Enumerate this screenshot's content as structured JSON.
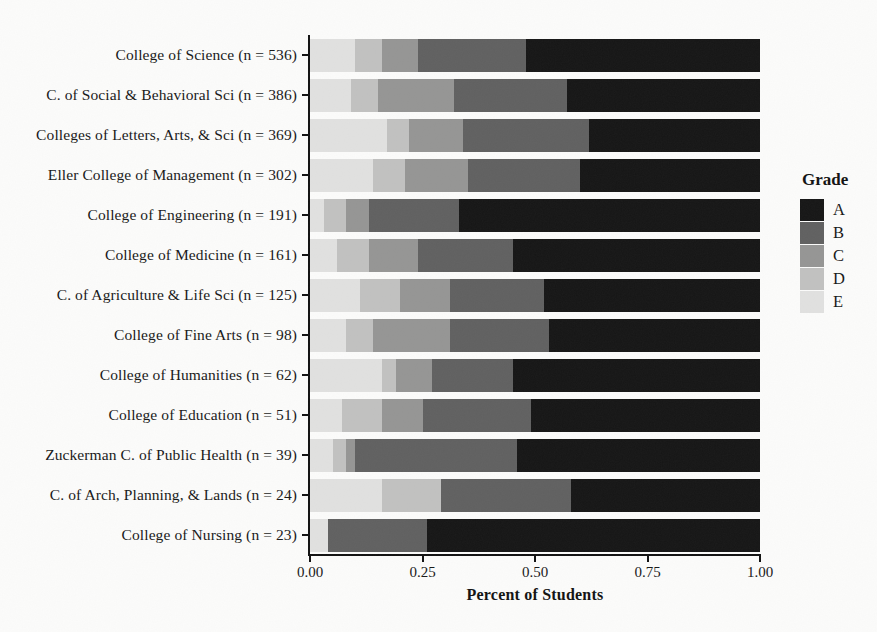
{
  "chart_data": {
    "type": "bar",
    "orientation": "horizontal",
    "stacked": true,
    "title": "",
    "xlabel": "Percent of Students",
    "ylabel": "",
    "xlim": [
      0,
      1
    ],
    "grid": false,
    "x_ticks": [
      {
        "value": 0.0,
        "label": "0.00"
      },
      {
        "value": 0.25,
        "label": "0.25"
      },
      {
        "value": 0.5,
        "label": "0.50"
      },
      {
        "value": 0.75,
        "label": "0.75"
      },
      {
        "value": 1.0,
        "label": "1.00"
      }
    ],
    "categories": [
      "College of Science (n = 536)",
      "C. of Social & Behavioral Sci (n = 386)",
      "Colleges of Letters, Arts, & Sci (n = 369)",
      "Eller College of Management (n = 302)",
      "College of Engineering (n = 191)",
      "College of Medicine (n = 161)",
      "C. of Agriculture & Life Sci (n = 125)",
      "College of Fine Arts (n = 98)",
      "College of Humanities (n = 62)",
      "College of Education (n = 51)",
      "Zuckerman C. of Public Health (n = 39)",
      "C. of Arch, Planning, & Lands (n = 24)",
      "College of Nursing (n = 23)"
    ],
    "n": [
      536,
      386,
      369,
      302,
      191,
      161,
      125,
      98,
      62,
      51,
      39,
      24,
      23
    ],
    "stack_order_left_to_right": [
      "E",
      "D",
      "C",
      "B",
      "A"
    ],
    "series": [
      {
        "name": "E",
        "color": "#e1e1e0",
        "values": [
          0.1,
          0.09,
          0.17,
          0.14,
          0.03,
          0.06,
          0.11,
          0.08,
          0.16,
          0.07,
          0.05,
          0.16,
          0.04
        ]
      },
      {
        "name": "D",
        "color": "#c1c1c0",
        "values": [
          0.06,
          0.06,
          0.05,
          0.07,
          0.05,
          0.07,
          0.09,
          0.06,
          0.03,
          0.09,
          0.03,
          0.13,
          0.0
        ]
      },
      {
        "name": "C",
        "color": "#959594",
        "values": [
          0.08,
          0.17,
          0.12,
          0.14,
          0.05,
          0.11,
          0.11,
          0.17,
          0.08,
          0.09,
          0.02,
          0.0,
          0.0
        ]
      },
      {
        "name": "B",
        "color": "#606060",
        "values": [
          0.24,
          0.25,
          0.28,
          0.25,
          0.2,
          0.21,
          0.21,
          0.22,
          0.18,
          0.24,
          0.36,
          0.29,
          0.22
        ]
      },
      {
        "name": "A",
        "color": "#151515",
        "values": [
          0.52,
          0.43,
          0.38,
          0.4,
          0.67,
          0.55,
          0.48,
          0.47,
          0.55,
          0.51,
          0.54,
          0.42,
          0.74
        ]
      }
    ],
    "legend": {
      "title": "Grade",
      "position": "right",
      "entries": [
        {
          "label": "A",
          "color": "#151515"
        },
        {
          "label": "B",
          "color": "#606060"
        },
        {
          "label": "C",
          "color": "#959594"
        },
        {
          "label": "D",
          "color": "#c1c1c0"
        },
        {
          "label": "E",
          "color": "#e1e1e0"
        }
      ]
    }
  }
}
